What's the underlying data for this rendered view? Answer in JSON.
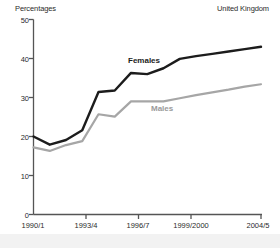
{
  "header": {
    "units_label": "Percentages",
    "region_label": "United Kingdom"
  },
  "axis": {
    "y_ticks": [
      "0",
      "10",
      "20",
      "30",
      "40",
      "50"
    ],
    "x_ticks": [
      "1990/1",
      "1993/4",
      "1996/7",
      "1999/2000",
      "2004/5"
    ]
  },
  "series_labels": {
    "females": "Females",
    "males": "Males"
  },
  "colors": {
    "females": "#1c1c1c",
    "males": "#a6a6a6",
    "axis": "#555555",
    "background": "#ffffff",
    "footer": "#f2f2f2"
  },
  "chart_data": {
    "type": "line",
    "title": "",
    "subtitle": "",
    "xlabel": "",
    "ylabel": "Percentages",
    "units": "Percentages",
    "region": "United Kingdom",
    "grid": false,
    "legend": "inline-labels",
    "ylim": [
      0,
      50
    ],
    "yticks": [
      0,
      10,
      20,
      30,
      40,
      50
    ],
    "x": [
      "1990/1",
      "1991/2",
      "1992/3",
      "1993/4",
      "1994/5",
      "1995/6",
      "1996/7",
      "1997/8",
      "1998/9",
      "1999/2000",
      "2000/1",
      "2001/2",
      "2002/3",
      "2003/4",
      "2004/5"
    ],
    "xtick_labels": [
      "1990/1",
      "1993/4",
      "1996/7",
      "1999/2000",
      "2004/5"
    ],
    "xtick_positions": [
      "1990/1",
      "1993/4",
      "1996/7",
      "1999/2000",
      "2004/5"
    ],
    "series": [
      {
        "name": "Females",
        "color": "#1c1c1c",
        "values": [
          20.0,
          17.9,
          19.1,
          21.6,
          31.4,
          31.8,
          36.3,
          36.0,
          37.5,
          39.9,
          40.6,
          41.2,
          41.8,
          42.4,
          43.0
        ]
      },
      {
        "name": "Males",
        "color": "#a6a6a6",
        "values": [
          17.2,
          16.3,
          17.8,
          18.8,
          25.7,
          25.1,
          29.0,
          29.0,
          29.0,
          29.8,
          30.6,
          31.3,
          32.0,
          32.8,
          33.4
        ]
      }
    ]
  }
}
